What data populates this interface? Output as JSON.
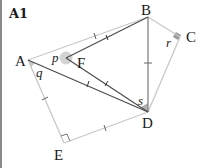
{
  "figure": {
    "id_label": "A1",
    "vertices": {
      "A": {
        "label": "A",
        "x": 26,
        "y": 60
      },
      "B": {
        "label": "B",
        "x": 146,
        "y": 17
      },
      "C": {
        "label": "C",
        "x": 178,
        "y": 37
      },
      "D": {
        "label": "D",
        "x": 146,
        "y": 112
      },
      "E": {
        "label": "E",
        "x": 62,
        "y": 143
      },
      "F": {
        "label": "F",
        "x": 64,
        "y": 58
      }
    },
    "angle_labels": {
      "p": "p",
      "q": "q",
      "r": "r",
      "s": "s"
    },
    "segments": [
      {
        "from": "A",
        "to": "B",
        "style": "light",
        "ticks": 1
      },
      {
        "from": "B",
        "to": "C",
        "style": "light",
        "ticks": 0
      },
      {
        "from": "C",
        "to": "D",
        "style": "light",
        "ticks": 0
      },
      {
        "from": "A",
        "to": "E",
        "style": "light",
        "ticks": 1
      },
      {
        "from": "E",
        "to": "D",
        "style": "light",
        "ticks": 1
      },
      {
        "from": "A",
        "to": "D",
        "style": "dark",
        "ticks": 1
      },
      {
        "from": "F",
        "to": "B",
        "style": "dark",
        "ticks": 1
      },
      {
        "from": "F",
        "to": "D",
        "style": "dark",
        "ticks": 1
      },
      {
        "from": "B",
        "to": "D",
        "style": "medium",
        "ticks": 1
      }
    ],
    "right_angles": [
      "C",
      "E"
    ],
    "colors": {
      "light": "#c8c8c8",
      "medium": "#8c8c8c",
      "dark": "#4a4a4a",
      "angle_fill": "#bdbdbd",
      "text": "#1a1a1a"
    }
  }
}
